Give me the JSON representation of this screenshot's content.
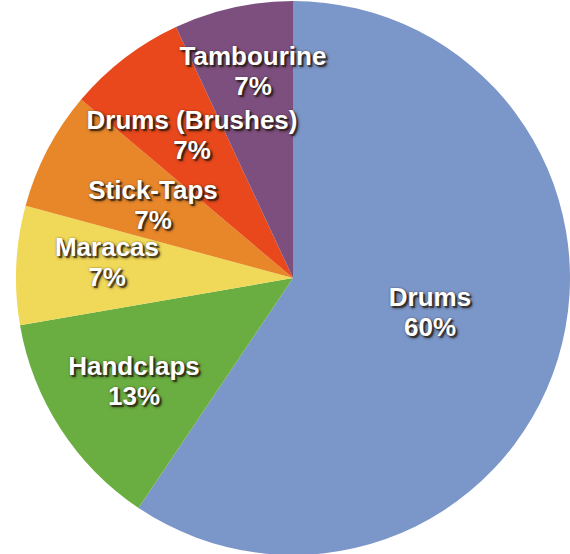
{
  "chart_data": {
    "type": "pie",
    "title": "",
    "subtitle": "",
    "xlabel": "",
    "ylabel": "",
    "legend_position": "none",
    "grid": false,
    "labels_inside_slices": true,
    "value_format": "percent",
    "categories": [
      "Drums",
      "Handclaps",
      "Maracas",
      "Stick-Taps",
      "Drums (Brushes)",
      "Tambourine"
    ],
    "values": [
      60,
      13,
      7,
      7,
      7,
      7
    ],
    "value_labels": [
      "60%",
      "13%",
      "7%",
      "7%",
      "7%",
      "7%"
    ],
    "colors": [
      "#7b96c8",
      "#6aae41",
      "#f0d858",
      "#e8872a",
      "#e8481c",
      "#7d4f7e"
    ],
    "slices": [
      {
        "name": "Drums",
        "value": 60,
        "value_label": "60%",
        "color": "#7b96c8",
        "start_angle": 0,
        "end_angle": 213.9,
        "label_x": 430,
        "label_y": 313,
        "font_size": 26
      },
      {
        "name": "Handclaps",
        "value": 13,
        "value_label": "13%",
        "color": "#6aae41",
        "start_angle": 213.9,
        "end_angle": 260.2,
        "label_x": 134,
        "label_y": 382,
        "font_size": 26
      },
      {
        "name": "Maracas",
        "value": 7,
        "value_label": "7%",
        "color": "#f0d858",
        "start_angle": 260.2,
        "end_angle": 285.1,
        "label_x": 107,
        "label_y": 263,
        "font_size": 26
      },
      {
        "name": "Stick-Taps",
        "value": 7,
        "value_label": "7%",
        "color": "#e8872a",
        "start_angle": 285.1,
        "end_angle": 310.1,
        "label_x": 153,
        "label_y": 206,
        "font_size": 26
      },
      {
        "name": "Drums (Brushes)",
        "value": 7,
        "value_label": "7%",
        "color": "#e8481c",
        "start_angle": 310.1,
        "end_angle": 335.0,
        "label_x": 192,
        "label_y": 136,
        "font_size": 26
      },
      {
        "name": "Tambourine",
        "value": 7,
        "value_label": "7%",
        "color": "#7d4f7e",
        "start_angle": 335.0,
        "end_angle": 360,
        "label_x": 253,
        "label_y": 72,
        "font_size": 26
      }
    ],
    "geometry": {
      "center_x": 293,
      "center_y": 278,
      "radius": 277,
      "background": "#ffffff",
      "label_color": "#ffffff"
    }
  }
}
